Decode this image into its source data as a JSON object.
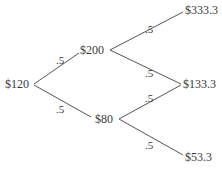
{
  "diagram": {
    "type": "binomial-tree",
    "nodes": {
      "root": "$120",
      "up": "$200",
      "down": "$80",
      "up_up": "$333.3",
      "middle": "$133.3",
      "down_down": "$53.3"
    },
    "probabilities": {
      "root_up": ".5",
      "root_down": ".5",
      "up_up": ".5",
      "up_down": ".5",
      "down_up": ".5",
      "down_down": ".5"
    },
    "line_color": "#555555",
    "text_color": "#3a3a3a"
  }
}
